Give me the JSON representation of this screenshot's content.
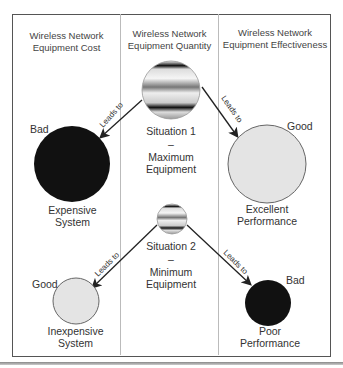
{
  "columns": [
    {
      "header_line1": "Wireless Network",
      "header_line2": "Equipment Cost"
    },
    {
      "header_line1": "Wireless Network",
      "header_line2": "Equipment Quantity"
    },
    {
      "header_line1": "Wireless Network",
      "header_line2": "Equipment Effectiveness"
    }
  ],
  "situation1": {
    "line1": "Situation 1",
    "dash": "–",
    "line2": "Maximum",
    "line3": "Equipment"
  },
  "situation2": {
    "line1": "Situation 2",
    "dash": "–",
    "line2": "Minimum",
    "line3": "Equipment"
  },
  "outcomes": {
    "expensive": {
      "rating": "Bad",
      "line1": "Expensive",
      "line2": "System"
    },
    "excellent": {
      "rating": "Good",
      "line1": "Excellent",
      "line2": "Performance"
    },
    "inexpensive": {
      "rating": "Good",
      "line1": "Inexpensive",
      "line2": "System"
    },
    "poor": {
      "rating": "Bad",
      "line1": "Poor",
      "line2": "Performance"
    }
  },
  "arrow_label": "Leads to",
  "colors": {
    "good": "#e4e4e4",
    "bad": "#111111",
    "border": "#555555",
    "divider": "#bbbbbb"
  }
}
